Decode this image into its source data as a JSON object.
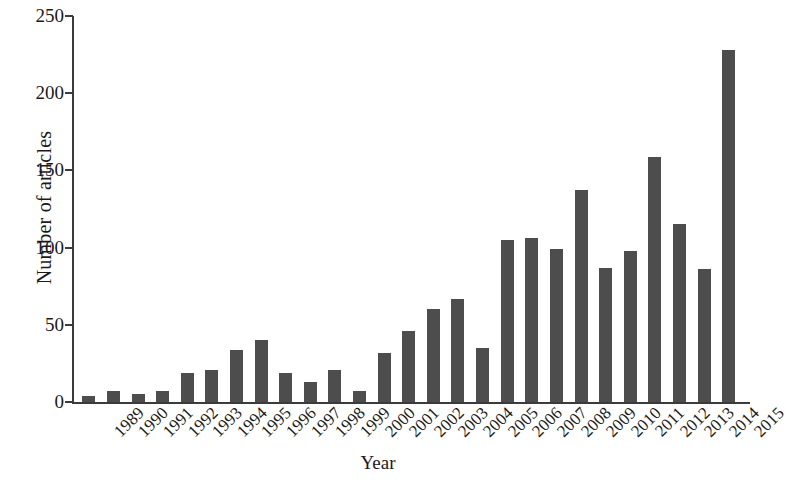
{
  "chart_data": {
    "type": "bar",
    "title": "",
    "xlabel": "Year",
    "ylabel": "Number of articles",
    "categories": [
      "1989",
      "1990",
      "1991",
      "1992",
      "1993",
      "1994",
      "1995",
      "1996",
      "1997",
      "1998",
      "1999",
      "2000",
      "2001",
      "2002",
      "2003",
      "2004",
      "2005",
      "2006",
      "2007",
      "2008",
      "2009",
      "2010",
      "2011",
      "2012",
      "2013",
      "2014",
      "2015"
    ],
    "values": [
      4,
      7,
      5,
      7,
      19,
      21,
      34,
      40,
      19,
      13,
      21,
      7,
      32,
      46,
      60,
      67,
      35,
      105,
      106,
      99,
      137,
      87,
      98,
      159,
      115,
      86,
      228
    ],
    "series": [
      {
        "name": "Number of articles",
        "values": [
          4,
          7,
          5,
          7,
          19,
          21,
          34,
          40,
          19,
          13,
          21,
          7,
          32,
          46,
          60,
          67,
          35,
          105,
          106,
          99,
          137,
          87,
          98,
          159,
          115,
          86,
          228
        ]
      }
    ],
    "ylim": [
      0,
      250
    ],
    "yticks": [
      0,
      50,
      100,
      150,
      200,
      250
    ],
    "ytick_labels": [
      "0",
      "50",
      "100",
      "150",
      "200",
      "250"
    ],
    "grid": false,
    "legend": false,
    "legend_position": "none",
    "bar_color": "#4d4d4d",
    "axis_color": "#3b3b3b",
    "background_color": "#ffffff"
  }
}
